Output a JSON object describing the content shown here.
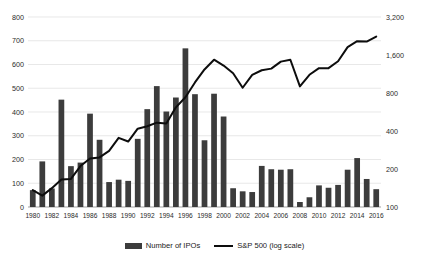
{
  "chart_data": {
    "type": "bar",
    "title": "",
    "xlabel": "",
    "ylabel": "",
    "grid": true,
    "legend_position": "bottom",
    "x": [
      1980,
      1981,
      1982,
      1983,
      1984,
      1985,
      1986,
      1987,
      1988,
      1989,
      1990,
      1991,
      1992,
      1993,
      1994,
      1995,
      1996,
      1997,
      1998,
      1999,
      2000,
      2001,
      2002,
      2003,
      2004,
      2005,
      2006,
      2007,
      2008,
      2009,
      2010,
      2011,
      2012,
      2013,
      2014,
      2015,
      2016
    ],
    "categories": [
      "1980",
      "1981",
      "1982",
      "1983",
      "1984",
      "1985",
      "1986",
      "1987",
      "1988",
      "1989",
      "1990",
      "1991",
      "1992",
      "1993",
      "1994",
      "1995",
      "1996",
      "1997",
      "1998",
      "1999",
      "2000",
      "2001",
      "2002",
      "2003",
      "2004",
      "2005",
      "2006",
      "2007",
      "2008",
      "2009",
      "2010",
      "2011",
      "2012",
      "2013",
      "2014",
      "2015",
      "2016"
    ],
    "xtick_labels": [
      "1980",
      "1982",
      "1984",
      "1986",
      "1988",
      "1990",
      "1992",
      "1994",
      "1996",
      "1998",
      "2000",
      "2002",
      "2004",
      "2006",
      "2008",
      "2010",
      "2012",
      "2014",
      "2016"
    ],
    "xlim": [
      1979.5,
      2016.5
    ],
    "axes": {
      "left": {
        "name": "Number of IPOs",
        "scale": "linear",
        "ylim": [
          0,
          800
        ],
        "ticks": [
          0,
          100,
          200,
          300,
          400,
          500,
          600,
          700,
          800
        ],
        "tick_labels": [
          "0",
          "100",
          "200",
          "300",
          "400",
          "500",
          "600",
          "700",
          "800"
        ]
      },
      "right": {
        "name": "S&P 500 (log scale)",
        "scale": "log",
        "ylim": [
          100,
          3200
        ],
        "ticks": [
          100,
          200,
          400,
          800,
          1600,
          3200
        ],
        "tick_labels": [
          "100",
          "200",
          "400",
          "800",
          "1,600",
          "3,200"
        ]
      }
    },
    "series": [
      {
        "name": "Number of IPOs",
        "type": "bar",
        "axis": "left",
        "color": "#3c3c3c",
        "values": [
          71,
          192,
          78,
          452,
          172,
          187,
          393,
          283,
          105,
          115,
          110,
          287,
          412,
          509,
          402,
          461,
          668,
          475,
          281,
          477,
          381,
          79,
          66,
          63,
          173,
          159,
          157,
          159,
          21,
          41,
          91,
          81,
          93,
          157,
          206,
          118,
          75
        ]
      },
      {
        "name": "S&P 500 (log scale)",
        "type": "line",
        "axis": "right",
        "color": "#0d0d0d",
        "values": [
          136,
          123,
          141,
          165,
          167,
          211,
          242,
          247,
          278,
          353,
          330,
          417,
          436,
          466,
          459,
          616,
          741,
          970,
          1229,
          1469,
          1320,
          1148,
          880,
          1112,
          1212,
          1248,
          1418,
          1468,
          903,
          1115,
          1258,
          1258,
          1426,
          1848,
          2059,
          2044,
          2239
        ]
      }
    ]
  },
  "legend": {
    "items": [
      {
        "label": "Number of IPOs",
        "marker": "bar-swatch",
        "color": "#3c3c3c"
      },
      {
        "label": "S&P 500 (log scale)",
        "marker": "line-swatch",
        "color": "#0d0d0d"
      }
    ]
  },
  "colors": {
    "bar": "#3c3c3c",
    "line": "#0d0d0d",
    "grid": "#d9d9d9",
    "axis": "#8c8c8c",
    "background": "#ffffff",
    "text": "#1a1a1a"
  }
}
